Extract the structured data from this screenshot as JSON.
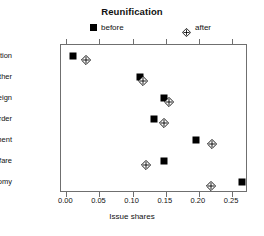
{
  "chart_data": {
    "type": "scatter",
    "title": "Reunification",
    "xlabel": "Issue shares",
    "ylabel": "",
    "xlim": [
      -0.008,
      0.274
    ],
    "grid": false,
    "legend_position": "top",
    "categories": [
      "Reunification",
      "Other",
      "Foreign",
      "Law and order",
      "Environment",
      "Welfare",
      "Economy"
    ],
    "series": [
      {
        "name": "before",
        "marker": "filled-square",
        "values": [
          0.01,
          0.111,
          0.147,
          0.132,
          0.195,
          0.148,
          0.265
        ]
      },
      {
        "name": "after",
        "marker": "crossed-diamond",
        "values": [
          0.03,
          0.115,
          0.155,
          0.147,
          0.22,
          0.12,
          0.218
        ]
      }
    ],
    "xticks": [
      0.0,
      0.05,
      0.1,
      0.15,
      0.2,
      0.25
    ],
    "xtick_labels": [
      "0.00",
      "0.05",
      "0.10",
      "0.15",
      "0.20",
      "0.25"
    ]
  },
  "legend": {
    "before_label": "before",
    "after_label": "after"
  },
  "colors": {
    "marker": "#000000",
    "axis": "#6f6f6f",
    "background": "#ffffff",
    "text": "#111111"
  }
}
